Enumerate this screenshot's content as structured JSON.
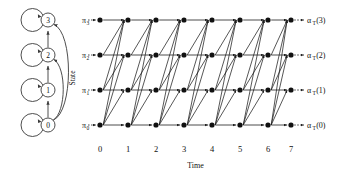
{
  "figure": {
    "title": "",
    "state_machine": {
      "axis_label": "State",
      "states": [
        {
          "id": 3,
          "label": "3",
          "cx": 48,
          "cy": 20
        },
        {
          "id": 2,
          "label": "2",
          "cx": 48,
          "cy": 55
        },
        {
          "id": 1,
          "label": "1",
          "cx": 48,
          "cy": 90
        },
        {
          "id": 0,
          "label": "0",
          "cx": 48,
          "cy": 125
        }
      ],
      "self_loops": [
        3,
        2,
        1,
        0
      ],
      "up_transitions": [
        {
          "from": 0,
          "to": 1
        },
        {
          "from": 1,
          "to": 2
        },
        {
          "from": 2,
          "to": 3
        }
      ],
      "curved_transitions": [
        {
          "from": 0,
          "to": 3
        },
        {
          "from": 0,
          "to": 2
        }
      ]
    },
    "trellis": {
      "x_axis_label": "Time",
      "time_ticks": [
        "0",
        "1",
        "2",
        "3",
        "4",
        "5",
        "6",
        "7"
      ],
      "time_x": [
        100,
        128,
        156,
        184,
        212,
        240,
        268,
        291
      ],
      "row_y": [
        20,
        55,
        90,
        125
      ],
      "row_states": [
        3,
        2,
        1,
        0
      ],
      "left_labels": [
        {
          "base": "π",
          "sub": "3",
          "state": 3
        },
        {
          "base": "π",
          "sub": "2",
          "state": 2
        },
        {
          "base": "π",
          "sub": "1",
          "state": 1
        },
        {
          "base": "π",
          "sub": "0",
          "state": 0
        }
      ],
      "right_labels": [
        {
          "base": "α",
          "sub": "T",
          "arg": "(3)",
          "state": 3
        },
        {
          "base": "α",
          "sub": "T",
          "arg": "(2)",
          "state": 2
        },
        {
          "base": "α",
          "sub": "T",
          "arg": "(1)",
          "state": 1
        },
        {
          "base": "α",
          "sub": "T",
          "arg": "(0)",
          "state": 0
        }
      ]
    },
    "colors": {
      "ink": "#111111",
      "line": "#1f1f1f",
      "state_stroke": "#3a3a3a",
      "background": "#ffffff"
    }
  }
}
